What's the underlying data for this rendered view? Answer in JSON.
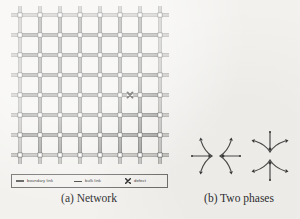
{
  "figure": {
    "background_color": "#f2f1ee",
    "ink_color": "#3a3a38"
  },
  "panel_a": {
    "caption": "(a) Network",
    "network": {
      "columns": 8,
      "rows": 8,
      "cell_size": 20,
      "origin_x": 12,
      "origin_y": 12,
      "stub_length": 9,
      "link_style": "double-line",
      "link_gap": 2.2,
      "bulk_link_color": "#3a3a38",
      "boundary_link_color": "#6e6d6a",
      "node_size": 4.2,
      "node_fill": "#ffffff",
      "node_stroke": "#2f2f2d",
      "defect": {
        "label": "defect",
        "marker": "x-cross",
        "column_from": 5,
        "column_to": 6,
        "row": 4,
        "color": "#1d1d1b",
        "size": 5.0
      }
    },
    "legend": {
      "items": [
        {
          "label": "boundary link",
          "swatch": "double-line-swatch"
        },
        {
          "label": "bulk link",
          "swatch": "single-line-swatch"
        },
        {
          "label": "defect",
          "swatch": "x-cross-swatch"
        }
      ]
    }
  },
  "panel_b": {
    "caption": "(b) Two phases",
    "phases": [
      {
        "name": "horizontal-phase",
        "orientation": "horizontal",
        "center_x": 38,
        "center_y": 32,
        "description": "saddle flow with inward horizontal arrows and curved vertical separatrices"
      },
      {
        "name": "vertical-phase",
        "orientation": "vertical",
        "center_x": 92,
        "center_y": 32,
        "description": "saddle flow with inward vertical arrows and curved horizontal separatrices"
      }
    ],
    "stroke_color": "#4a4a48",
    "arrow_color": "#3a3a38"
  }
}
